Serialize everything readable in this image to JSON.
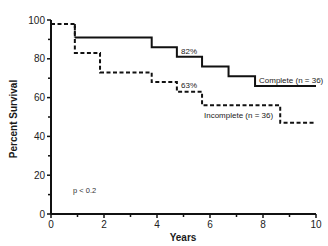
{
  "chart_data": {
    "type": "line",
    "subtype": "kaplan-meier step",
    "title": "",
    "xlabel": "Years",
    "ylabel": "Percent Survival",
    "xlim": [
      0,
      10
    ],
    "ylim": [
      0,
      100
    ],
    "x_ticks": [
      0,
      2,
      4,
      6,
      8,
      10
    ],
    "x_minor_ticks": [
      1,
      3,
      5,
      7,
      9
    ],
    "y_ticks": [
      0,
      20,
      40,
      60,
      80,
      100
    ],
    "y_minor_ticks": [
      10,
      30,
      50,
      70,
      90
    ],
    "grid": false,
    "series": [
      {
        "name": "Complete (n = 36)",
        "style": "solid",
        "steps": [
          {
            "x": 0.9,
            "y": 91
          },
          {
            "x": 3.8,
            "y": 86
          },
          {
            "x": 4.75,
            "y": 81
          },
          {
            "x": 5.7,
            "y": 76
          },
          {
            "x": 6.7,
            "y": 71
          },
          {
            "x": 7.7,
            "y": 66
          },
          {
            "x": 10.0,
            "y": 66
          }
        ],
        "annotation": {
          "text": "82%",
          "x": 5.0,
          "y": 84
        }
      },
      {
        "name": "Incomplete (n = 36)",
        "style": "dashed",
        "steps": [
          {
            "x": 0,
            "y": 98
          },
          {
            "x": 0.9,
            "y": 83
          },
          {
            "x": 1.85,
            "y": 73
          },
          {
            "x": 3.8,
            "y": 68
          },
          {
            "x": 4.75,
            "y": 63
          },
          {
            "x": 5.7,
            "y": 56
          },
          {
            "x": 8.65,
            "y": 47
          },
          {
            "x": 10.0,
            "y": 47
          }
        ],
        "annotation": {
          "text": "63%",
          "x": 5.0,
          "y": 65
        }
      }
    ],
    "annotations": [
      {
        "text": "p < 0.2",
        "x": 0.9,
        "y": 12
      }
    ],
    "legend": "inline labels near series ends"
  },
  "labels": {
    "xlabel": "Years",
    "ylabel": "Percent Survival",
    "complete": "Complete (n = 36)",
    "incomplete": "Incomplete (n = 36)",
    "complete_pct": "82%",
    "incomplete_pct": "63%",
    "pvalue": "p < 0.2"
  }
}
